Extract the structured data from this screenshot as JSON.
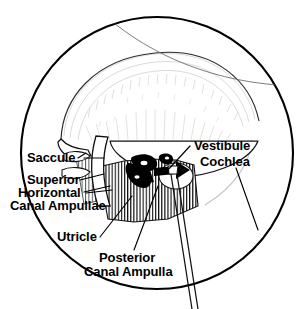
{
  "figure": {
    "kind": "anatomical-illustration",
    "background_color": "#ffffff",
    "ink_color": "#000000",
    "faint_ink_color": "#b8b8b8",
    "mid_ink_color": "#8a8a8a"
  },
  "labels": {
    "saccule": "Saccule",
    "superior": "Superior",
    "horizontal": "Horizontal",
    "canal_ampullae": "Canal Ampullae",
    "utricle": "Utricle",
    "posterior": "Posterior",
    "canal_ampulla": "Canal Ampulla",
    "vestibule": "Vestibule",
    "cochlea": "Cochlea"
  },
  "regions": {
    "outer_field": "circular-operative-field-outline",
    "bone_dome": "faint-hatched-temporal-bone-dome",
    "hatched_block": "vertically-hatched-bone-region",
    "black_labyrinth": "black-filled-membranous-labyrinth",
    "probe": "surgical-probe-shaft"
  }
}
